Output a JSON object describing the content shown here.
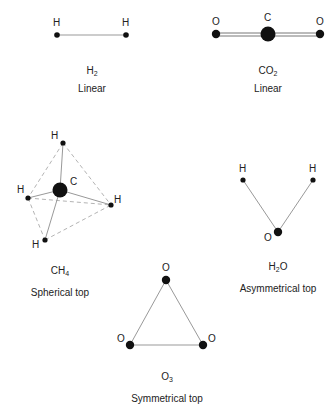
{
  "molecules": [
    {
      "id": "h2",
      "formula_main": "H",
      "formula_sub": "2",
      "formula_tail": "",
      "type": "Linear",
      "atoms": [
        {
          "label": "H"
        },
        {
          "label": "H"
        }
      ]
    },
    {
      "id": "co2",
      "formula_main": "CO",
      "formula_sub": "2",
      "formula_tail": "",
      "type": "Linear",
      "atoms": [
        {
          "label": "O"
        },
        {
          "label": "C"
        },
        {
          "label": "O"
        }
      ]
    },
    {
      "id": "ch4",
      "formula_main": "CH",
      "formula_sub": "4",
      "formula_tail": "",
      "type": "Spherical top",
      "atoms": [
        {
          "label": "H"
        },
        {
          "label": "C"
        },
        {
          "label": "H"
        },
        {
          "label": "H"
        },
        {
          "label": "H"
        }
      ]
    },
    {
      "id": "h2o",
      "formula_main": "H",
      "formula_sub": "2",
      "formula_tail": "O",
      "type": "Asymmetrical top",
      "atoms": [
        {
          "label": "H"
        },
        {
          "label": "H"
        },
        {
          "label": "O"
        }
      ]
    },
    {
      "id": "o3",
      "formula_main": "O",
      "formula_sub": "3",
      "formula_tail": "",
      "type": "Symmetrical top",
      "atoms": [
        {
          "label": "O"
        },
        {
          "label": "O"
        },
        {
          "label": "O"
        }
      ]
    }
  ],
  "colors": {
    "atom": "#111111",
    "bond": "#999999",
    "dashed": "#aaaaaa"
  }
}
